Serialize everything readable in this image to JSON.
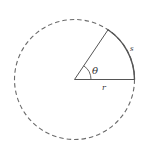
{
  "diagram": {
    "labels": {
      "arc": "s",
      "radius": "r",
      "angle": "θ"
    },
    "geometry": {
      "center": [
        74.5,
        79.5
      ],
      "radius": 60,
      "sector_angle_deg": 56
    },
    "colors": {
      "stroke": "#555555",
      "dashed_circle": "#666666",
      "background": "#ffffff"
    }
  }
}
